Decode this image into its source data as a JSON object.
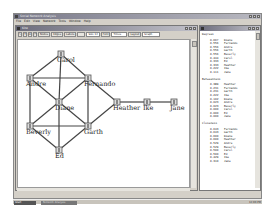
{
  "app": {
    "title": "Social Network Analysis",
    "menu": [
      "File",
      "Edit",
      "View",
      "Network",
      "Tools",
      "Window",
      "Help"
    ]
  },
  "network_window": {
    "title": "Kite",
    "toolbar": {
      "tools": [
        "pointer",
        "text",
        "A",
        "node"
      ],
      "buttons": [
        "Nodes",
        "Edges",
        "Labels",
        "",
        "Size 12"
      ],
      "font_label": "Font",
      "font_value": "Times",
      "layout_label": "Layout",
      "layout_value": "Graph",
      "color_label": "Color",
      "color_value": "Black"
    }
  },
  "graph": {
    "nodes": [
      {
        "id": "carol",
        "label": "Carol",
        "x": 43,
        "y": 14
      },
      {
        "id": "andre",
        "label": "Andre",
        "x": 12,
        "y": 38
      },
      {
        "id": "fernando",
        "label": "Fernando",
        "x": 70,
        "y": 38
      },
      {
        "id": "diane",
        "label": "Diane",
        "x": 41,
        "y": 62
      },
      {
        "id": "heather",
        "label": "Heather",
        "x": 99,
        "y": 62
      },
      {
        "id": "ike",
        "label": "Ike",
        "x": 129,
        "y": 62
      },
      {
        "id": "jane",
        "label": "Jane",
        "x": 156,
        "y": 62
      },
      {
        "id": "beverly",
        "label": "Beverly",
        "x": 12,
        "y": 86
      },
      {
        "id": "garth",
        "label": "Garth",
        "x": 70,
        "y": 86
      },
      {
        "id": "ed",
        "label": "Ed",
        "x": 41,
        "y": 110
      }
    ],
    "edges": [
      [
        "carol",
        "andre"
      ],
      [
        "carol",
        "fernando"
      ],
      [
        "carol",
        "diane"
      ],
      [
        "andre",
        "fernando"
      ],
      [
        "andre",
        "diane"
      ],
      [
        "andre",
        "beverly"
      ],
      [
        "fernando",
        "diane"
      ],
      [
        "fernando",
        "garth"
      ],
      [
        "fernando",
        "heather"
      ],
      [
        "diane",
        "beverly"
      ],
      [
        "diane",
        "garth"
      ],
      [
        "diane",
        "ed"
      ],
      [
        "beverly",
        "garth"
      ],
      [
        "beverly",
        "ed"
      ],
      [
        "garth",
        "ed"
      ],
      [
        "garth",
        "heather"
      ],
      [
        "heather",
        "ike"
      ],
      [
        "ike",
        "jane"
      ]
    ]
  },
  "results": {
    "degrees": {
      "title": "Degrees",
      "rows": [
        {
          "value": "0.667",
          "name": "Diane"
        },
        {
          "value": "0.556",
          "name": "Fernando"
        },
        {
          "value": "0.556",
          "name": "Andre"
        },
        {
          "value": "0.556",
          "name": "Garth"
        },
        {
          "value": "0.556",
          "name": "Beverly"
        },
        {
          "value": "0.444",
          "name": "Carol"
        },
        {
          "value": "0.333",
          "name": "Ed"
        },
        {
          "value": "0.333",
          "name": "Heather"
        },
        {
          "value": "0.222",
          "name": "Ike"
        },
        {
          "value": "0.111",
          "name": "Jane"
        }
      ]
    },
    "betweenness": {
      "title": "Betweenness",
      "rows": [
        {
          "value": "0.389",
          "name": "Heather"
        },
        {
          "value": "0.231",
          "name": "Fernando"
        },
        {
          "value": "0.231",
          "name": "Garth"
        },
        {
          "value": "0.222",
          "name": "Ike"
        },
        {
          "value": "0.102",
          "name": "Diane"
        },
        {
          "value": "0.023",
          "name": "Andre"
        },
        {
          "value": "0.023",
          "name": "Beverly"
        },
        {
          "value": "0.000",
          "name": "Carol"
        },
        {
          "value": "0.000",
          "name": "Ed"
        },
        {
          "value": "0.000",
          "name": "Jane"
        }
      ]
    },
    "closeness": {
      "title": "Closeness",
      "rows": [
        {
          "value": "0.643",
          "name": "Fernando"
        },
        {
          "value": "0.643",
          "name": "Garth"
        },
        {
          "value": "0.600",
          "name": "Diane"
        },
        {
          "value": "0.600",
          "name": "Heather"
        },
        {
          "value": "0.529",
          "name": "Andre"
        },
        {
          "value": "0.529",
          "name": "Beverly"
        },
        {
          "value": "0.500",
          "name": "Carol"
        },
        {
          "value": "0.500",
          "name": "Ed"
        },
        {
          "value": "0.429",
          "name": "Ike"
        },
        {
          "value": "0.310",
          "name": "Jane"
        }
      ]
    }
  },
  "taskbar": {
    "start_label": "Start",
    "task_label": "Network Analysis",
    "clock": "12:00 PM"
  }
}
